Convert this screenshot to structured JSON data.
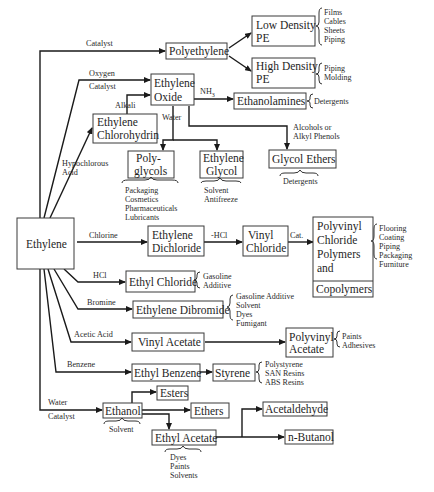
{
  "diagram": {
    "nodes": {
      "ethylene": "Ethylene",
      "polyethylene": "Polyethylene",
      "ldpe": [
        "Low Density",
        "PE"
      ],
      "hdpe": [
        "High Density",
        "PE"
      ],
      "ethylene_oxide": [
        "Ethylene",
        "Oxide"
      ],
      "ethylene_chlorohydrin": [
        "Ethylene",
        "Chlorohydrin"
      ],
      "ethanolamines": "Ethanolamines",
      "polyglycols": [
        "Poly-",
        "glycols"
      ],
      "ethylene_glycol": [
        "Ethylene",
        "Glycol"
      ],
      "glycol_ethers": "Glycol Ethers",
      "ethylene_dichloride": [
        "Ethylene",
        "Dichloride"
      ],
      "vinyl_chloride": [
        "Vinyl",
        "Chloride"
      ],
      "pvc": [
        "Polyvinyl",
        "Chloride",
        "Polymers",
        "and"
      ],
      "copolymers": "Copolymers",
      "ethyl_chloride": "Ethyl Chloride",
      "ethylene_dibromide": "Ethylene Dibromide",
      "vinyl_acetate": "Vinyl Acetate",
      "polyvinyl_acetate": [
        "Polyvinyl",
        "Acetate"
      ],
      "ethyl_benzene": "Ethyl Benzene",
      "styrene": "Styrene",
      "ethanol": "Ethanol",
      "esters": "Esters",
      "ethers": "Ethers",
      "ethyl_acetate": "Ethyl Acetate",
      "acetaldehyde": "Acetaldehyde",
      "n_butanol": "n-Butanol"
    },
    "edge_labels": {
      "catalyst_pe": "Catalyst",
      "oxygen": "Oxygen",
      "catalyst_eo": "Catalyst",
      "alkali": "Alkali",
      "nh3": "NH",
      "nh3_sub": "3",
      "water_eo": "Water",
      "hypochlorous": [
        "Hypochlorous",
        "Acid"
      ],
      "alcohols": [
        "Alcohols or",
        "Alkyl Phenols"
      ],
      "chlorine": "Chlorine",
      "minus_hcl": "-HCl",
      "cat": "Cat.",
      "hcl": "HCl",
      "bromine": "Bromine",
      "acetic_acid": "Acetic Acid",
      "benzene": "Benzene",
      "water_eth": "Water",
      "catalyst_eth": "Catalyst"
    },
    "uses": {
      "ldpe": [
        "Films",
        "Cables",
        "Sheets",
        "Piping"
      ],
      "hdpe": [
        "Piping",
        "Molding"
      ],
      "ethanolamines": [
        "Detergents"
      ],
      "polyglycols": [
        "Packaging",
        "Cosmetics",
        "Pharmaceuticals",
        "Lubricants"
      ],
      "ethylene_glycol": [
        "Solvent",
        "Antifreeze"
      ],
      "glycol_ethers": [
        "Detergents"
      ],
      "pvc": [
        "Flooring",
        "Coating",
        "Piping",
        "Packaging",
        "Furniture"
      ],
      "ethyl_chloride": [
        "Gasoline",
        "Additive"
      ],
      "ethylene_dibromide": [
        "Gasoline Additive",
        "Solvent",
        "Dyes",
        "Fumigant"
      ],
      "polyvinyl_acetate": [
        "Paints",
        "Adhesives"
      ],
      "styrene": [
        "Polystyrene",
        "SAN Resins",
        "ABS Resins"
      ],
      "ethanol": [
        "Solvent"
      ],
      "ethyl_acetate": [
        "Dyes",
        "Paints",
        "Solvents"
      ]
    }
  }
}
